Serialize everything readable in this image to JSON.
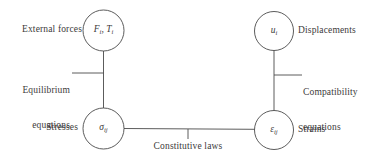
{
  "diagram": {
    "background_color": "#ffffff",
    "stroke_color": "#4a4a4a",
    "text_color": "#3c3a3a",
    "nodes": [
      {
        "id": "external-forces",
        "symbol_main_1": "F",
        "symbol_sub_1": "i",
        "symbol_sep": ", ",
        "symbol_main_2": "T",
        "symbol_sub_2": "i",
        "label": "External forces",
        "label_position": "left",
        "cx": 103.5,
        "cy": 30.5,
        "r": 20.5
      },
      {
        "id": "displacements",
        "symbol_main_1": "u",
        "symbol_sub_1": "i",
        "label": "Displacements",
        "label_position": "right",
        "cx": 274,
        "cy": 31,
        "r": 19.5
      },
      {
        "id": "stresses",
        "symbol_main_1": "σ",
        "symbol_sub_1": "ij",
        "label": "Stresses",
        "label_position": "left",
        "cx": 103.5,
        "cy": 128.5,
        "r": 20.5
      },
      {
        "id": "strains",
        "symbol_main_1": "ε",
        "symbol_sub_1": "ij",
        "label": "Strains",
        "label_position": "right",
        "cx": 274,
        "cy": 130,
        "r": 19.5
      }
    ],
    "edges": [
      {
        "id": "equilibrium",
        "from": "external-forces",
        "to": "stresses",
        "label_line_1": "Equilibrium",
        "label_line_2": "equations",
        "label_position": "left",
        "orientation": "vertical"
      },
      {
        "id": "compatibility",
        "from": "displacements",
        "to": "strains",
        "label_line_1": "Compatibility",
        "label_line_2": "equations",
        "label_position": "right",
        "orientation": "vertical"
      },
      {
        "id": "constitutive",
        "from": "stresses",
        "to": "strains",
        "label_line_1": "Constitutive laws",
        "label_position": "below",
        "orientation": "horizontal"
      }
    ]
  },
  "labels": {
    "external_forces": "External forces",
    "displacements": "Displacements",
    "stresses": "Stresses",
    "strains": "Strains",
    "equilibrium_line1": "Equilibrium",
    "equilibrium_line2": "equations",
    "compatibility_line1": "Compatibility",
    "compatibility_line2": "equations",
    "constitutive": "Constitutive laws"
  }
}
